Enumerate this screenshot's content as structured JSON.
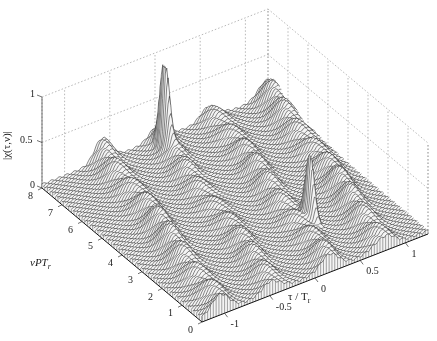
{
  "chart_data": {
    "type": "surface3d",
    "title": "",
    "xlabel": "τ / T_r",
    "ylabel": "νPT_r",
    "zlabel": "|χ(τ,ν)|",
    "x_ticks": [
      "-1",
      "-0.5",
      "0",
      "0.5",
      "1"
    ],
    "x_tick_values": [
      -1,
      -0.5,
      0,
      0.5,
      1
    ],
    "y_ticks": [
      "0",
      "1",
      "2",
      "3",
      "4",
      "5",
      "6",
      "7",
      "8"
    ],
    "y_tick_values": [
      0,
      1,
      2,
      3,
      4,
      5,
      6,
      7,
      8
    ],
    "z_ticks": [
      "0",
      "0.5",
      "1"
    ],
    "z_tick_values": [
      0,
      0.5,
      1
    ],
    "xlim": [
      -1.25,
      1.25
    ],
    "ylim": [
      0,
      8
    ],
    "zlim": [
      0,
      1
    ],
    "grid": true,
    "colormap": "white faces, black mesh lines",
    "peaks": [
      {
        "tau": -0.05,
        "nu": 7.3,
        "height": 0.98,
        "label": "main peak (back)"
      },
      {
        "tau": 0.43,
        "nu": 2.2,
        "height": 0.72,
        "label": "secondary peak (front)"
      }
    ],
    "ridge_bands": [
      {
        "tau0": -1.05,
        "slope": 0.06,
        "level": 0.18
      },
      {
        "tau0": -0.45,
        "slope": 0.06,
        "level": 0.14
      },
      {
        "tau0": 0.15,
        "slope": 0.06,
        "level": 0.16
      },
      {
        "tau0": 0.75,
        "slope": 0.06,
        "level": 0.18
      }
    ]
  },
  "labels": {
    "x_axis": "τ / T",
    "x_axis_sub": "r",
    "y_axis": "νPT",
    "y_axis_sub": "r",
    "z_axis": "|χ(τ,ν)|"
  }
}
